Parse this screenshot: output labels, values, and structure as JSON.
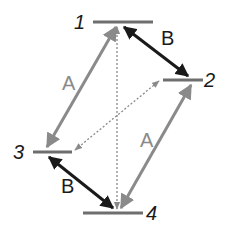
{
  "diagram": {
    "type": "energy-level-diagram",
    "colors": {
      "level_line": "#6e6e6e",
      "arrow_A": "#8a8a8a",
      "arrow_B": "#1a1a1a",
      "dotted": "#8a8a8a",
      "level_label": "#1a1a1a",
      "label_A": "#8a8a8a",
      "label_B": "#1a1a1a"
    },
    "levels": [
      {
        "id": "1",
        "label": "1",
        "x1": 93,
        "x2": 153,
        "y": 22,
        "label_x": 74,
        "label_y": 29
      },
      {
        "id": "2",
        "label": "2",
        "x1": 163,
        "x2": 203,
        "y": 80,
        "label_x": 204,
        "label_y": 87
      },
      {
        "id": "3",
        "label": "3",
        "x1": 33,
        "x2": 72,
        "y": 152,
        "label_x": 13,
        "label_y": 159
      },
      {
        "id": "4",
        "label": "4",
        "x1": 83,
        "x2": 143,
        "y": 213,
        "label_x": 146,
        "label_y": 220
      }
    ],
    "transitions": [
      {
        "name": "A",
        "from": "3",
        "to": "1",
        "style": "solid-gray",
        "label": "A",
        "label_x": 62,
        "label_y": 90
      },
      {
        "name": "A",
        "from": "4",
        "to": "2",
        "style": "solid-gray",
        "label": "A",
        "label_x": 140,
        "label_y": 147
      },
      {
        "name": "B",
        "from": "1",
        "to": "2",
        "style": "solid-black",
        "label": "B",
        "label_x": 161,
        "label_y": 45
      },
      {
        "name": "B",
        "from": "3",
        "to": "4",
        "style": "solid-black",
        "label": "B",
        "label_x": 61,
        "label_y": 193
      },
      {
        "name": "",
        "from": "1",
        "to": "4",
        "style": "dotted",
        "label": ""
      },
      {
        "name": "",
        "from": "3",
        "to": "2",
        "style": "dotted",
        "label": ""
      }
    ],
    "labels": {
      "level_1": "1",
      "level_2": "2",
      "level_3": "3",
      "level_4": "4",
      "arrow_A_left": "A",
      "arrow_A_right": "A",
      "arrow_B_top": "B",
      "arrow_B_bottom": "B"
    }
  }
}
